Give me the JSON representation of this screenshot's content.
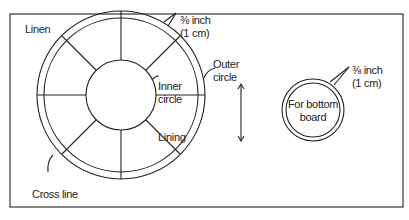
{
  "diagram": {
    "labels": {
      "linen": "Linen",
      "seam_top_1": "⅜ inch",
      "seam_top_2": "(1 cm)",
      "outer_circle_1": "Outer",
      "outer_circle_2": "circle",
      "inner_circle_1": "Inner",
      "inner_circle_2": "circle",
      "lining": "Lining",
      "cross_line": "Cross line",
      "seam_right_1": "⅜ inch",
      "seam_right_2": "(1 cm)",
      "bottom_board_1": "For bottom",
      "bottom_board_2": "board"
    },
    "colors": {
      "stroke": "#222222",
      "background": "#ffffff"
    }
  }
}
